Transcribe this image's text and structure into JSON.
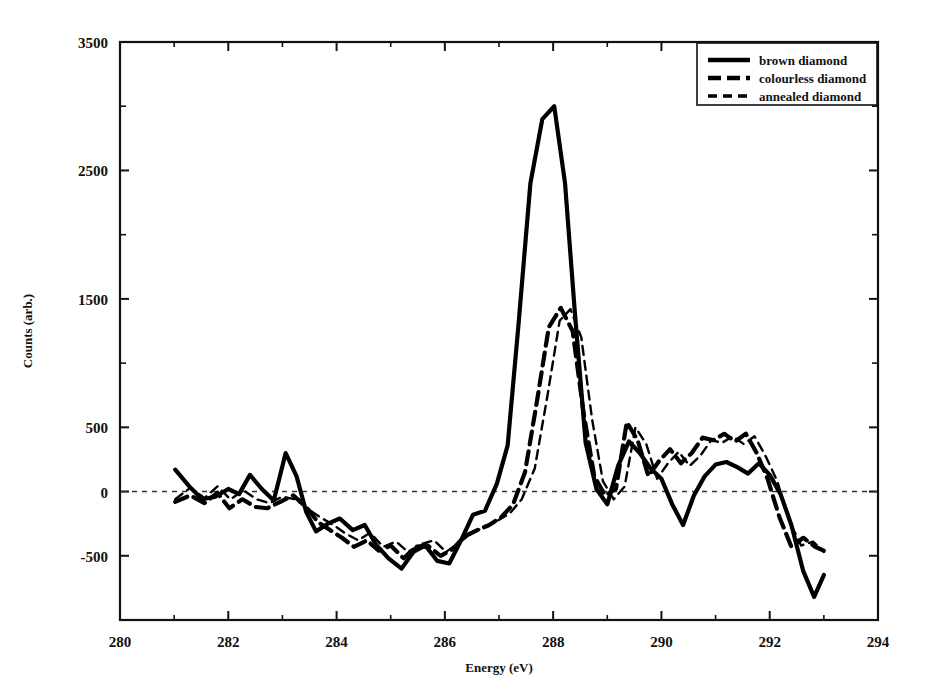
{
  "chart_data": {
    "type": "line",
    "title": "",
    "xlabel": "Energy (eV)",
    "ylabel": "Counts (arb.)",
    "xlim": [
      280,
      294
    ],
    "ylim": [
      -1000,
      3500
    ],
    "xticks": [
      280,
      282,
      284,
      286,
      288,
      290,
      292,
      294
    ],
    "xtick_labels": [
      "280",
      "282",
      "284",
      "286",
      "288",
      "290",
      "292",
      "294"
    ],
    "yticks": [
      -500,
      0,
      500,
      1500,
      2500,
      3500
    ],
    "ytick_labels": [
      "-500",
      "0",
      "500",
      "1500",
      "2500",
      "3500"
    ],
    "yticks_minor": [
      -1000,
      1000,
      2000,
      3000
    ],
    "grid": false,
    "zero_line": true,
    "legend_position": "top-right",
    "series": [
      {
        "name": "brown diamond",
        "style": "solid",
        "width": 4.2,
        "color": "#000000",
        "x": [
          281.02,
          281.28,
          281.52,
          281.76,
          282.0,
          282.2,
          282.4,
          282.62,
          282.84,
          283.06,
          283.26,
          283.44,
          283.62,
          283.84,
          284.06,
          284.3,
          284.52,
          284.74,
          284.96,
          285.2,
          285.42,
          285.64,
          285.86,
          286.08,
          286.3,
          286.52,
          286.74,
          286.96,
          287.16,
          287.36,
          287.58,
          287.8,
          288.02,
          288.22,
          288.4,
          288.6,
          288.8,
          289.0,
          289.2,
          289.4,
          289.6,
          289.8,
          290.0,
          290.2,
          290.4,
          290.6,
          290.8,
          291.0,
          291.2,
          291.4,
          291.6,
          291.8,
          292.0,
          292.2,
          292.4,
          292.62,
          292.82,
          293.0
        ],
        "y": [
          170,
          40,
          -60,
          -40,
          20,
          -20,
          130,
          20,
          -70,
          300,
          120,
          -160,
          -310,
          -250,
          -210,
          -300,
          -260,
          -420,
          -520,
          -600,
          -470,
          -420,
          -540,
          -560,
          -380,
          -180,
          -150,
          60,
          360,
          1300,
          2400,
          2900,
          3000,
          2400,
          1400,
          380,
          20,
          -100,
          200,
          390,
          300,
          180,
          100,
          -100,
          -260,
          -30,
          120,
          210,
          230,
          190,
          140,
          220,
          130,
          -20,
          -260,
          -620,
          -820,
          -650
        ]
      },
      {
        "name": "colourless diamond",
        "style": "dashed",
        "width": 4.2,
        "color": "#000000",
        "x": [
          281.02,
          281.3,
          281.56,
          281.8,
          282.02,
          282.26,
          282.5,
          282.72,
          282.96,
          283.2,
          283.44,
          283.66,
          283.88,
          284.1,
          284.32,
          284.56,
          284.78,
          285.0,
          285.24,
          285.46,
          285.68,
          285.92,
          286.14,
          286.36,
          286.6,
          286.82,
          287.04,
          287.26,
          287.48,
          287.7,
          287.92,
          288.14,
          288.36,
          288.56,
          288.76,
          288.96,
          289.16,
          289.36,
          289.56,
          289.76,
          289.96,
          290.16,
          290.36,
          290.56,
          290.76,
          290.96,
          291.16,
          291.36,
          291.56,
          291.76,
          291.96,
          292.18,
          292.4,
          292.62,
          292.84,
          293.0
        ],
        "y": [
          -80,
          -30,
          -90,
          -10,
          -130,
          -60,
          -120,
          -130,
          -80,
          -30,
          -120,
          -240,
          -300,
          -360,
          -430,
          -380,
          -460,
          -420,
          -520,
          -430,
          -420,
          -500,
          -450,
          -350,
          -300,
          -260,
          -200,
          -100,
          150,
          700,
          1280,
          1430,
          1250,
          620,
          120,
          -30,
          20,
          540,
          400,
          120,
          240,
          330,
          220,
          300,
          420,
          400,
          450,
          390,
          450,
          300,
          100,
          -200,
          -430,
          -360,
          -430,
          -460
        ]
      },
      {
        "name": "annealed diamond",
        "style": "dashed-thin",
        "width": 2.4,
        "color": "#000000",
        "x": [
          281.02,
          281.3,
          281.56,
          281.8,
          282.04,
          282.28,
          282.52,
          282.76,
          283.0,
          283.24,
          283.48,
          283.7,
          283.94,
          284.18,
          284.4,
          284.62,
          284.86,
          285.1,
          285.32,
          285.56,
          285.8,
          286.02,
          286.26,
          286.5,
          286.72,
          286.96,
          287.2,
          287.42,
          287.66,
          287.9,
          288.12,
          288.32,
          288.52,
          288.72,
          288.92,
          289.12,
          289.32,
          289.52,
          289.72,
          289.92,
          290.12,
          290.32,
          290.52,
          290.72,
          290.92,
          291.12,
          291.32,
          291.52,
          291.72,
          291.92,
          292.14,
          292.36,
          292.58,
          292.8,
          293.0
        ],
        "y": [
          -60,
          30,
          -50,
          40,
          -60,
          10,
          -60,
          -90,
          -40,
          -60,
          -140,
          -200,
          -260,
          -330,
          -380,
          -320,
          -430,
          -390,
          -470,
          -410,
          -380,
          -470,
          -400,
          -320,
          -280,
          -230,
          -170,
          -60,
          180,
          760,
          1330,
          1420,
          1200,
          560,
          80,
          -60,
          40,
          500,
          370,
          100,
          220,
          310,
          200,
          280,
          400,
          380,
          430,
          370,
          430,
          280,
          80,
          -230,
          -420,
          -390,
          -470
        ]
      }
    ]
  },
  "legend": {
    "entries": [
      {
        "label": "brown diamond"
      },
      {
        "label": "colourless diamond"
      },
      {
        "label": "annealed diamond"
      }
    ]
  }
}
